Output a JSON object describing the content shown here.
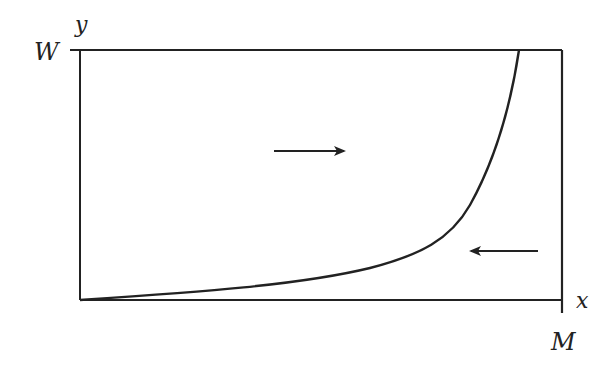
{
  "diagram": {
    "labels": {
      "y_axis": "y",
      "x_axis": "x",
      "y_max": "W",
      "x_max": "M"
    },
    "arrows": [
      {
        "direction": "right",
        "region": "upper-left of curve"
      },
      {
        "direction": "left",
        "region": "lower-right of curve"
      }
    ],
    "colors": {
      "stroke": "#222222",
      "background": "#ffffff"
    }
  }
}
